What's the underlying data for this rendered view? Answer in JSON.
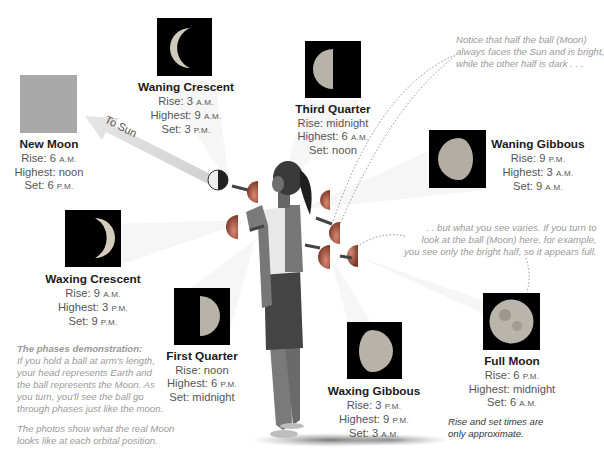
{
  "phases": [
    {
      "id": "new-moon",
      "name": "New Moon",
      "rise": "6",
      "rise_unit": "A.M.",
      "highest": "noon",
      "highest_unit": "",
      "set": "6",
      "set_unit": "P.M.",
      "image_color": "#a8a8a8"
    },
    {
      "id": "waning-crescent",
      "name": "Waning Crescent",
      "rise": "3",
      "rise_unit": "A.M.",
      "highest": "9",
      "highest_unit": "A.M.",
      "set": "3",
      "set_unit": "P.M."
    },
    {
      "id": "third-quarter",
      "name": "Third Quarter",
      "rise": "midnight",
      "rise_unit": "",
      "highest": "6",
      "highest_unit": "A.M.",
      "set": "noon",
      "set_unit": ""
    },
    {
      "id": "waning-gibbous",
      "name": "Waning Gibbous",
      "rise": "9",
      "rise_unit": "P.M.",
      "highest": "3",
      "highest_unit": "A.M.",
      "set": "9",
      "set_unit": "A.M."
    },
    {
      "id": "waxing-crescent",
      "name": "Waxing Crescent",
      "rise": "9",
      "rise_unit": "A.M.",
      "highest": "3",
      "highest_unit": "P.M.",
      "set": "9",
      "set_unit": "P.M."
    },
    {
      "id": "first-quarter",
      "name": "First Quarter",
      "rise": "noon",
      "rise_unit": "",
      "highest": "6",
      "highest_unit": "P.M.",
      "set": "midnight",
      "set_unit": ""
    },
    {
      "id": "waxing-gibbous",
      "name": "Waxing Gibbous",
      "rise": "3",
      "rise_unit": "P.M.",
      "highest": "9",
      "highest_unit": "P.M.",
      "set": "3",
      "set_unit": "A.M."
    },
    {
      "id": "full-moon",
      "name": "Full Moon",
      "rise": "6",
      "rise_unit": "P.M.",
      "highest": "midnight",
      "highest_unit": "",
      "set": "6",
      "set_unit": "A.M."
    }
  ],
  "labels": {
    "rise": "Rise:",
    "highest": "Highest:",
    "set": "Set:",
    "to_sun": "To Sun"
  },
  "notes": {
    "half_faces_sun": [
      "Notice that half the ball (Moon)",
      "always faces the Sun and is bright,",
      "while the other half is dark . . ."
    ],
    "what_you_see": [
      ". . but what you see varies. If you turn to",
      "look at the ball (Moon) here, for example,",
      "you see only the bright half, so it appears full."
    ],
    "demo_title": "The phases demonstration:",
    "demo_body": [
      "If you hold a ball at arm's length,",
      "your head represents Earth and",
      "the ball represents the Moon. As",
      "you turn, you'll see the ball go",
      "through phases just like the moon."
    ],
    "photos": [
      "The photos show what the real Moon",
      "looks like at each orbital position."
    ],
    "approx": [
      "Rise and set times are",
      "only approximate."
    ]
  },
  "colors": {
    "background": "#ffffff",
    "title_text": "#1a1a1a",
    "body_text": "#555555",
    "note_text": "#9a9a9a",
    "new_moon_gray": "#a8a8a8",
    "ball_color": "#b8604a"
  }
}
